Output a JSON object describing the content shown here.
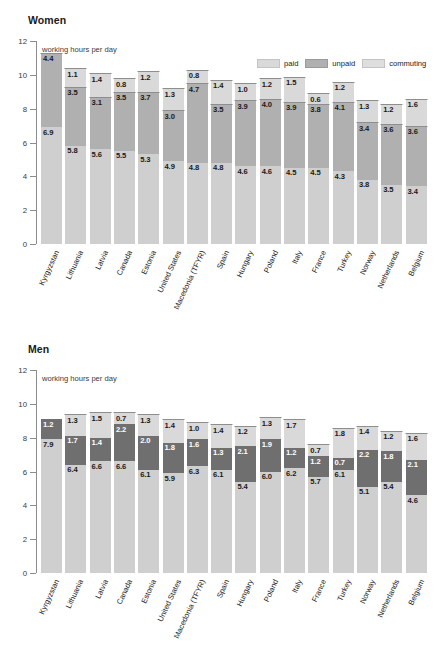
{
  "panels": [
    {
      "title": "Women",
      "axis_unit": "working hours per day",
      "legend": [
        {
          "label": "paid",
          "key": "paid"
        },
        {
          "label": "unpaid",
          "key": "unpaid"
        },
        {
          "label": "commuting",
          "key": "commuting"
        }
      ]
    },
    {
      "title": "Men",
      "axis_unit": "working hours per day",
      "legend": [
        {
          "label": "paid",
          "key": "paid"
        },
        {
          "label": "unpaid",
          "key": "unpaid"
        },
        {
          "label": "commuting",
          "key": "commuting"
        }
      ]
    }
  ],
  "y_ticks": [
    "0",
    "2",
    "4",
    "6",
    "8",
    "10",
    "12"
  ],
  "colors": {
    "paid": "#cfcfcf",
    "unpaid_women": "#b0b0b0",
    "unpaid_men": "#6f6f6f",
    "commuting": "#d9d9d9",
    "axis": "#8c8c8c",
    "text": "#1a1a1a"
  },
  "chart_data": [
    {
      "type": "bar",
      "title": "Women",
      "subtitle": "working hours per day",
      "stacked": true,
      "xlabel": "",
      "ylabel": "working hours per day",
      "ylim": [
        0,
        12
      ],
      "yticks": [
        0,
        2,
        4,
        6,
        8,
        10,
        12
      ],
      "grid": false,
      "legend_position": "top-right",
      "categories": [
        "Kyrgyzstan",
        "Lithuania",
        "Latvia",
        "Canada",
        "Estonia",
        "United States",
        "Macedonia (TFYR)",
        "Spain",
        "Hungary",
        "Poland",
        "Italy",
        "France",
        "Turkey",
        "Norway",
        "Netherlands",
        "Belgium"
      ],
      "series": [
        {
          "name": "paid",
          "values": [
            6.9,
            5.8,
            5.6,
            5.5,
            5.3,
            4.9,
            4.8,
            4.8,
            4.6,
            4.6,
            4.5,
            4.5,
            4.3,
            3.8,
            3.5,
            3.4
          ]
        },
        {
          "name": "unpaid",
          "values": [
            4.4,
            3.5,
            3.1,
            3.5,
            3.7,
            3.0,
            4.7,
            3.5,
            3.9,
            4.0,
            3.9,
            3.8,
            4.1,
            3.4,
            3.6,
            3.6
          ]
        },
        {
          "name": "commuting",
          "values": [
            null,
            1.1,
            1.4,
            0.8,
            1.2,
            1.3,
            0.8,
            1.4,
            1.0,
            1.2,
            1.5,
            0.6,
            1.2,
            1.3,
            1.2,
            1.6
          ]
        }
      ]
    },
    {
      "type": "bar",
      "title": "Men",
      "subtitle": "working hours per day",
      "stacked": true,
      "xlabel": "",
      "ylabel": "working hours per day",
      "ylim": [
        0,
        12
      ],
      "yticks": [
        0,
        2,
        4,
        6,
        8,
        10,
        12
      ],
      "grid": false,
      "legend_position": "top-right",
      "categories": [
        "Kyrgyzstan",
        "Lithuania",
        "Latvia",
        "Canada",
        "Estonia",
        "United States",
        "Macedonia (TFYR)",
        "Spain",
        "Hungary",
        "Poland",
        "Italy",
        "France",
        "Turkey",
        "Norway",
        "Netherlands",
        "Belgium"
      ],
      "series": [
        {
          "name": "paid",
          "values": [
            7.9,
            6.4,
            6.6,
            6.6,
            6.1,
            5.9,
            6.3,
            6.1,
            5.4,
            6.0,
            6.2,
            5.7,
            6.1,
            5.1,
            5.4,
            4.6
          ]
        },
        {
          "name": "unpaid",
          "values": [
            1.2,
            1.7,
            1.4,
            2.2,
            2.0,
            1.8,
            1.6,
            1.3,
            2.1,
            1.9,
            1.2,
            1.2,
            0.7,
            2.2,
            1.8,
            2.1
          ]
        },
        {
          "name": "commuting",
          "values": [
            null,
            1.3,
            1.5,
            0.7,
            1.3,
            1.4,
            1.0,
            1.4,
            1.2,
            1.3,
            1.7,
            0.7,
            1.8,
            1.4,
            1.2,
            1.6
          ]
        }
      ]
    }
  ]
}
